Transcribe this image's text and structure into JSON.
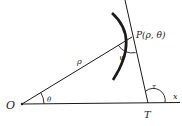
{
  "diagram": {
    "labels": {
      "origin": "O",
      "point": "P(ρ, θ)",
      "radius": "ρ",
      "theta": "θ",
      "psi": "ψ",
      "tau": "τ",
      "tangent_point": "T",
      "x_axis": "x"
    },
    "colors": {
      "ink": "#1a1a1a",
      "background": "#ffffff"
    }
  }
}
